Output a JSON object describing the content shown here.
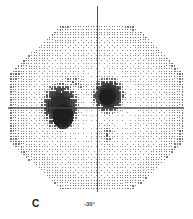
{
  "figure": {
    "panel_label": "C",
    "type": "grayscale-visual-field-plot",
    "background_color": "#ffffff",
    "ink_color": "#2b2b2b"
  },
  "axis_labels": {
    "inferior": "-30°"
  },
  "chart_data": {
    "type": "heatmap",
    "title": "",
    "subtitle": "",
    "xlabel": "",
    "ylabel": "",
    "annotations": [
      "C",
      "-30°"
    ],
    "legend_position": "none",
    "grid": false,
    "xlim": [
      -30,
      30
    ],
    "ylim": [
      -30,
      30
    ],
    "x_tick_labels": [],
    "y_tick_labels": [
      "-30°"
    ],
    "plot_shape": "octagon",
    "grid_spacing_px": 2.6,
    "meridians": {
      "vertical_x": 0,
      "horizontal_y": 0,
      "line_color": "#555555"
    },
    "value_scale": {
      "min": 0,
      "max": 1,
      "description": "0 = full sensitivity (white/light stipple), 1 = dense black scotoma"
    },
    "features": [
      {
        "name": "left-scotoma",
        "kind": "dense-defect",
        "center_x": -13.0,
        "center_y": 0.5,
        "radius_x": 7.5,
        "radius_y": 9.0,
        "intensity": 0.97
      },
      {
        "name": "left-scotoma-core",
        "kind": "dense-defect",
        "center_x": -12.0,
        "center_y": -3.0,
        "radius_x": 4.0,
        "radius_y": 4.5,
        "intensity": 1.0
      },
      {
        "name": "blind-spot",
        "kind": "dense-defect",
        "center_x": 4.0,
        "center_y": 4.0,
        "radius_x": 6.5,
        "radius_y": 7.0,
        "intensity": 0.98
      },
      {
        "name": "blind-spot-core",
        "kind": "dense-defect",
        "center_x": 3.5,
        "center_y": 3.5,
        "radius_x": 3.0,
        "radius_y": 3.0,
        "intensity": 1.0
      },
      {
        "name": "superior-arcuate-band",
        "kind": "partial-defect",
        "center_x": -8.0,
        "center_y": 8.5,
        "radius_x": 10.0,
        "radius_y": 4.0,
        "rotation_deg": -25,
        "intensity": 0.46
      },
      {
        "name": "inferior-column",
        "kind": "partial-defect",
        "center_x": 3.5,
        "center_y": -9.0,
        "radius_x": 4.0,
        "radius_y": 8.0,
        "intensity": 0.44
      },
      {
        "name": "left-peri-halo",
        "kind": "partial-defect",
        "center_x": -13.0,
        "center_y": 0.0,
        "radius_x": 11.0,
        "radius_y": 12.0,
        "intensity": 0.3
      },
      {
        "name": "mid-superior-haze",
        "kind": "partial-defect",
        "center_x": -4.0,
        "center_y": 16.0,
        "radius_x": 13.0,
        "radius_y": 9.0,
        "intensity": 0.12
      },
      {
        "name": "peripheral-gradient",
        "kind": "background-gradient",
        "intensity": 0.2,
        "description": "sensitivity falls off gradually toward the octagonal periphery"
      }
    ]
  }
}
